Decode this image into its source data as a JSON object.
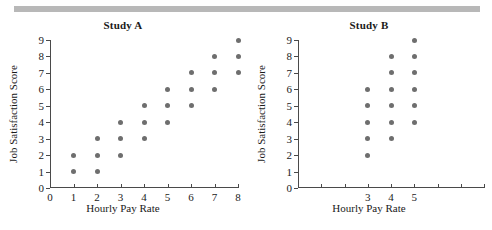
{
  "page": {
    "background_color": "#ffffff",
    "top_bar_color": "#b8b8b8",
    "dot_color": "#6e6e6e",
    "axis_color": "#4a4a4a"
  },
  "chart_data": [
    {
      "type": "scatter",
      "title": "Study A",
      "xlabel": "Hourly Pay Rate",
      "ylabel": "Job Satisfaction Score",
      "xlim": [
        0,
        8
      ],
      "ylim": [
        0,
        9
      ],
      "xticks": [
        0,
        1,
        2,
        3,
        4,
        5,
        6,
        7,
        8
      ],
      "xticklabels": [
        "0",
        "1",
        "2",
        "3",
        "4",
        "5",
        "6",
        "7",
        "8"
      ],
      "yticks": [
        0,
        1,
        2,
        3,
        4,
        5,
        6,
        7,
        8,
        9
      ],
      "yticklabels": [
        "0",
        "1",
        "2",
        "3",
        "4",
        "5",
        "6",
        "7",
        "8",
        "9"
      ],
      "grid": false,
      "legend": "none",
      "points": [
        {
          "x": 1,
          "y": 1
        },
        {
          "x": 1,
          "y": 2
        },
        {
          "x": 2,
          "y": 1
        },
        {
          "x": 2,
          "y": 2
        },
        {
          "x": 2,
          "y": 3
        },
        {
          "x": 3,
          "y": 2
        },
        {
          "x": 3,
          "y": 3
        },
        {
          "x": 3,
          "y": 4
        },
        {
          "x": 4,
          "y": 3
        },
        {
          "x": 4,
          "y": 4
        },
        {
          "x": 4,
          "y": 5
        },
        {
          "x": 5,
          "y": 4
        },
        {
          "x": 5,
          "y": 5
        },
        {
          "x": 5,
          "y": 6
        },
        {
          "x": 6,
          "y": 5
        },
        {
          "x": 6,
          "y": 6
        },
        {
          "x": 6,
          "y": 7
        },
        {
          "x": 7,
          "y": 6
        },
        {
          "x": 7,
          "y": 7
        },
        {
          "x": 7,
          "y": 8
        },
        {
          "x": 8,
          "y": 7
        },
        {
          "x": 8,
          "y": 8
        },
        {
          "x": 8,
          "y": 9
        }
      ]
    },
    {
      "type": "scatter",
      "title": "Study B",
      "xlabel": "Hourly Pay Rate",
      "ylabel": "Job Satisfaction Score",
      "xlim": [
        0,
        8
      ],
      "ylim": [
        0,
        9
      ],
      "xticks": [
        0,
        1,
        2,
        3,
        4,
        5,
        6,
        7,
        8
      ],
      "xticklabels": [
        "",
        "",
        "",
        "3",
        "4",
        "5",
        "",
        "",
        ""
      ],
      "yticks": [
        0,
        1,
        2,
        3,
        4,
        5,
        6,
        7,
        8,
        9
      ],
      "yticklabels": [
        "0",
        "1",
        "2",
        "3",
        "4",
        "5",
        "6",
        "7",
        "8",
        "9"
      ],
      "grid": false,
      "legend": "none",
      "points": [
        {
          "x": 3,
          "y": 2
        },
        {
          "x": 3,
          "y": 3
        },
        {
          "x": 3,
          "y": 4
        },
        {
          "x": 3,
          "y": 5
        },
        {
          "x": 3,
          "y": 6
        },
        {
          "x": 4,
          "y": 3
        },
        {
          "x": 4,
          "y": 4
        },
        {
          "x": 4,
          "y": 5
        },
        {
          "x": 4,
          "y": 6
        },
        {
          "x": 4,
          "y": 7
        },
        {
          "x": 4,
          "y": 8
        },
        {
          "x": 5,
          "y": 4
        },
        {
          "x": 5,
          "y": 5
        },
        {
          "x": 5,
          "y": 6
        },
        {
          "x": 5,
          "y": 7
        },
        {
          "x": 5,
          "y": 8
        },
        {
          "x": 5,
          "y": 9
        }
      ]
    }
  ]
}
